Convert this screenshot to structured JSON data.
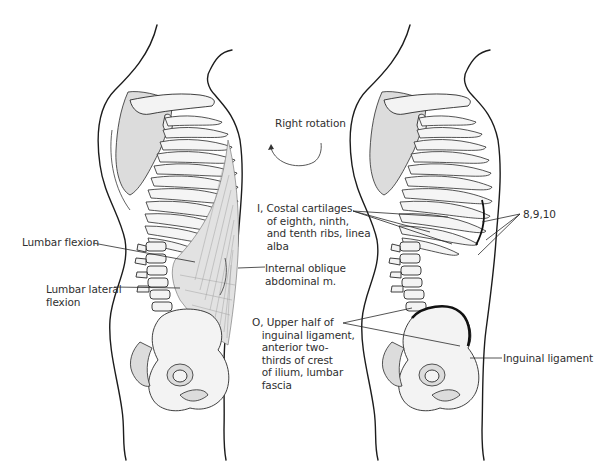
{
  "figure": {
    "type": "anatomical illustration",
    "panels": [
      {
        "name": "left",
        "view": "lateral trunk skeleton with muscle",
        "labels": {
          "lumbar_flexion": "Lumbar flexion",
          "lumbar_lateral_flexion": "Lumbar lateral\nflexion",
          "insertion": "I, Costal cartilages\n   of eighth, ninth,\n   and tenth ribs, linea\n   alba",
          "muscle": "Internal oblique\nabdominal m.",
          "origin": "O, Upper half of\n   inguinal ligament,\n   anterior two-\n   thirds of crest\n   of ilium, lumbar\n   fascia"
        }
      },
      {
        "name": "right",
        "view": "lateral trunk skeleton showing attachments",
        "labels": {
          "ribs": "8,9,10",
          "inguinal": "Inguinal ligament"
        }
      }
    ],
    "action": {
      "label": "Right rotation",
      "icon": "curved-arrow-icon"
    }
  }
}
